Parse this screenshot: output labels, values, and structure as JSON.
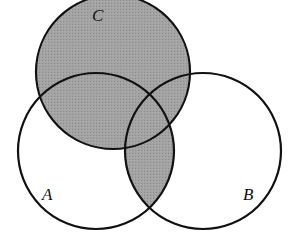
{
  "diagram": {
    "type": "venn",
    "sets": [
      {
        "id": "A",
        "label": "A",
        "cx": 96,
        "cy": 151,
        "r": 78,
        "label_x": 49,
        "label_y": 200
      },
      {
        "id": "B",
        "label": "B",
        "cx": 203,
        "cy": 151,
        "r": 78,
        "label_x": 248,
        "label_y": 200
      },
      {
        "id": "C",
        "label": "C",
        "cx": 113,
        "cy": 72,
        "r": 77,
        "label_x": 99,
        "label_y": 20
      }
    ],
    "shaded_region": "C ∪ (A ∩ B)",
    "colors": {
      "shade": "#9e9e9e",
      "stroke": "#111111",
      "background": "#ffffff"
    }
  }
}
